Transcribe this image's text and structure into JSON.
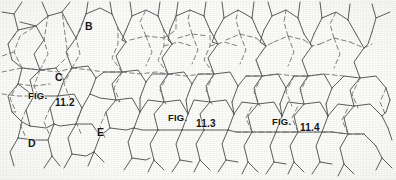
{
  "figure": {
    "type": "hexagonal-lattice-diagram",
    "background_color": "#fdfdfb",
    "solid_line_color": "#4a4a4a",
    "dashed_line_color": "#6d6d6d",
    "width": 396,
    "height": 180
  },
  "captions": [
    {
      "id": "fig-11-2",
      "prefix": "FIG.",
      "number": "11.2",
      "x": 28,
      "y": 90,
      "num_x": 55,
      "num_y": 97
    },
    {
      "id": "fig-11-3",
      "prefix": "FIG.",
      "number": "11.3",
      "x": 168,
      "y": 112,
      "num_x": 196,
      "num_y": 118
    },
    {
      "id": "fig-11-4",
      "prefix": "FIG.",
      "number": "11.4",
      "x": 272,
      "y": 116,
      "num_x": 300,
      "num_y": 122
    }
  ],
  "node_labels": [
    {
      "id": "label-b",
      "text": "B",
      "x": 85,
      "y": 20
    },
    {
      "id": "label-c",
      "text": "C",
      "x": 55,
      "y": 71
    },
    {
      "id": "label-d",
      "text": "D",
      "x": 28,
      "y": 137
    },
    {
      "id": "label-e",
      "text": "E",
      "x": 97,
      "y": 126
    }
  ],
  "lattice": {
    "solid_paths": [
      "M 22 2 L 14 14 L 2 12",
      "M 14 14 L 18 30",
      "M 42 2 L 48 16",
      "M 48 16 L 36 26 L 20 22",
      "M 48 16 L 62 12 L 70 2",
      "M 62 12 L 68 24",
      "M 88 2 L 86 14",
      "M 86 14 L 100 8 L 112 14",
      "M 112 14 L 110 2",
      "M 112 14 L 118 28",
      "M 86 14 L 80 30",
      "M 130 2 L 132 16",
      "M 132 16 L 146 10 L 158 16",
      "M 158 16 L 160 2",
      "M 158 16 L 164 30",
      "M 132 16 L 126 30",
      "M 178 2 L 176 16",
      "M 176 16 L 190 10 L 204 16",
      "M 204 16 L 206 2",
      "M 204 16 L 210 30",
      "M 176 16 L 170 30",
      "M 222 2 L 224 18",
      "M 224 18 L 238 10 L 252 18",
      "M 252 18 L 254 2",
      "M 252 18 L 258 32",
      "M 224 18 L 216 32",
      "M 268 2 L 272 16 L 286 10 L 298 18",
      "M 298 18 L 300 2",
      "M 298 18 L 304 34",
      "M 272 16 L 264 30",
      "M 320 2 L 322 18",
      "M 322 18 L 336 12 L 348 20",
      "M 348 20 L 350 4",
      "M 348 20 L 356 34",
      "M 322 18 L 314 34",
      "M 372 4 L 376 18 L 390 12",
      "M 376 18 L 372 32",
      "M 18 30 L 8 44 L 12 60",
      "M 18 30 L 36 26",
      "M 36 26 L 44 40",
      "M 44 40 L 34 54 L 40 70",
      "M 68 24 L 76 38",
      "M 76 38 L 66 52 L 72 68",
      "M 80 30 L 76 38",
      "M 118 28 L 126 42",
      "M 126 42 L 116 56 L 122 72",
      "M 126 30 L 122 40",
      "M 122 40 L 126 42",
      "M 164 30 L 172 44",
      "M 172 44 L 162 58 L 168 74",
      "M 170 30 L 168 40 L 172 44",
      "M 210 30 L 218 44",
      "M 218 44 L 208 58 L 214 74",
      "M 216 32 L 212 42 L 218 44",
      "M 258 32 L 266 46",
      "M 266 46 L 256 60 L 262 76",
      "M 264 30 L 260 42 L 266 46",
      "M 304 34 L 312 46",
      "M 312 46 L 302 60 L 308 76",
      "M 314 34 L 310 44 L 312 46",
      "M 356 34 L 364 48",
      "M 364 48 L 354 62 L 360 78",
      "M 372 32 L 368 44 L 364 48",
      "M 12 60 L 22 68",
      "M 22 68 L 18 84",
      "M 40 70 L 30 80 L 34 96",
      "M 22 68 L 40 70",
      "M 40 70 L 56 68 L 64 80",
      "M 64 80 L 58 96",
      "M 72 68 L 64 80",
      "M 72 68 L 88 66 L 96 78",
      "M 96 78 L 90 94",
      "M 122 72 L 112 84 L 116 100",
      "M 122 72 L 104 72 L 96 78",
      "M 122 72 L 138 70 L 146 82",
      "M 146 82 L 140 98",
      "M 168 74 L 160 86 L 164 102",
      "M 168 74 L 152 74 L 146 82",
      "M 168 74 L 184 72 L 192 84",
      "M 192 84 L 186 100",
      "M 214 74 L 206 86 L 210 102",
      "M 214 74 L 198 74 L 192 84",
      "M 214 74 L 230 72 L 238 86",
      "M 238 86 L 232 102",
      "M 262 76 L 254 88 L 258 104",
      "M 262 76 L 246 76 L 238 86",
      "M 262 76 L 278 74 L 286 88",
      "M 286 88 L 280 104",
      "M 308 76 L 300 88 L 304 104",
      "M 308 76 L 294 76 L 286 88",
      "M 308 76 L 324 74 L 332 88",
      "M 332 88 L 326 104",
      "M 360 78 L 350 90 L 354 106",
      "M 360 78 L 344 76 L 332 88",
      "M 360 78 L 376 76 L 386 88",
      "M 386 88 L 390 100",
      "M 18 84 L 8 96 L 12 112",
      "M 18 84 L 34 96",
      "M 34 96 L 26 110 L 30 126",
      "M 58 96 L 50 108 L 54 124",
      "M 58 96 L 42 96 L 34 96",
      "M 58 96 L 74 94 L 82 108",
      "M 82 108 L 76 124",
      "M 90 94 L 82 108",
      "M 116 100 L 106 112 L 110 128",
      "M 116 100 L 100 98 L 90 94",
      "M 116 100 L 132 98 L 140 112",
      "M 140 112 L 134 128",
      "M 140 98 L 140 112",
      "M 164 102 L 154 114 L 158 130",
      "M 164 102 L 148 100 L 140 112",
      "M 164 102 L 180 100 L 188 114",
      "M 188 114 L 182 130",
      "M 186 100 L 188 114",
      "M 210 102 L 200 114 L 204 130",
      "M 210 102 L 194 100 L 188 114",
      "M 210 102 L 226 100 L 234 114",
      "M 234 114 L 228 130",
      "M 232 102 L 234 114",
      "M 258 104 L 248 116 L 252 132",
      "M 258 104 L 242 102 L 234 114",
      "M 258 104 L 274 102 L 282 116",
      "M 282 116 L 276 132",
      "M 280 104 L 282 116",
      "M 304 104 L 294 116 L 298 132",
      "M 304 104 L 288 102 L 282 116",
      "M 304 104 L 320 102 L 328 116",
      "M 328 116 L 322 132",
      "M 326 104 L 328 116",
      "M 354 106 L 344 118 L 348 134",
      "M 354 106 L 338 104 L 328 116",
      "M 354 106 L 370 104 L 382 116",
      "M 382 116 L 388 128",
      "M 12 112 L 22 122 L 18 138",
      "M 30 126 L 22 122",
      "M 30 126 L 46 128 L 54 124",
      "M 54 124 L 48 140 L 52 156",
      "M 76 124 L 68 138 L 72 154",
      "M 76 124 L 60 126 L 54 124",
      "M 76 124 L 92 124 L 100 136",
      "M 100 136 L 94 152",
      "M 110 128 L 100 136",
      "M 110 128 L 126 130 L 134 128",
      "M 134 128 L 128 142 L 132 158",
      "M 158 130 L 150 144 L 154 160",
      "M 158 130 L 142 130 L 134 128",
      "M 158 130 L 174 130 L 182 130",
      "M 182 130 L 176 144 L 180 160",
      "M 204 130 L 196 144 L 200 160",
      "M 204 130 L 190 130 L 182 130",
      "M 204 130 L 220 130 L 228 130",
      "M 228 130 L 222 144 L 226 160",
      "M 252 132 L 244 146 L 248 162",
      "M 252 132 L 236 132 L 228 130",
      "M 252 132 L 268 132 L 276 132",
      "M 276 132 L 270 146 L 274 162",
      "M 298 132 L 290 146 L 294 162",
      "M 298 132 L 284 132 L 276 132",
      "M 298 132 L 314 132 L 322 132",
      "M 322 132 L 316 146 L 320 162",
      "M 348 134 L 340 148 L 344 164",
      "M 348 134 L 332 132 L 322 132",
      "M 348 134 L 364 134 L 376 146",
      "M 376 146 L 382 158",
      "M 18 138 L 10 152 L 14 166",
      "M 18 138 L 34 140 L 48 140",
      "M 52 156 L 44 168",
      "M 52 156 L 60 166",
      "M 72 154 L 64 168",
      "M 72 154 L 86 156 L 94 152",
      "M 94 152 L 88 166",
      "M 94 152 L 104 162",
      "M 132 158 L 124 170",
      "M 132 158 L 146 160 L 150 158",
      "M 154 160 L 148 172",
      "M 154 160 L 164 170",
      "M 180 160 L 172 172",
      "M 180 160 L 192 162",
      "M 200 160 L 194 172",
      "M 200 160 L 210 170",
      "M 226 160 L 218 172",
      "M 226 160 L 238 162",
      "M 248 162 L 242 174",
      "M 248 162 L 258 172",
      "M 274 162 L 266 174",
      "M 274 162 L 286 164",
      "M 294 162 L 288 174",
      "M 294 162 L 304 172",
      "M 320 162 L 312 174",
      "M 320 162 L 332 164",
      "M 344 164 L 338 176",
      "M 344 164 L 354 174",
      "M 382 158 L 376 170",
      "M 382 158 L 392 168",
      "M 388 128 L 392 140",
      "M 390 100 L 386 112",
      "M 386 112 L 382 116"
    ],
    "dashed_paths": [
      "M 2 72 L 22 68 L 40 70 L 56 68",
      "M 22 68 L 14 52 L 20 36 L 36 26",
      "M 14 52 L 2 56",
      "M 40 70 L 48 54 L 44 40 L 48 16",
      "M 40 70 L 34 86 L 40 100 L 34 96",
      "M 40 70 L 58 72 L 72 68",
      "M 56 68 L 68 56 L 62 12",
      "M 72 68 L 80 54 L 76 38 L 86 14",
      "M 72 68 L 64 84 L 70 98",
      "M 72 68 L 90 70 L 104 72 L 122 72",
      "M 122 72 L 112 58 L 118 44 L 118 28",
      "M 122 72 L 114 88 L 120 102 L 116 100",
      "M 122 72 L 140 74 L 156 72 L 168 74",
      "M 168 74 L 158 60 L 164 46 L 164 30",
      "M 168 74 L 160 90 L 166 104",
      "M 168 74 L 186 76 L 202 74 L 214 74",
      "M 214 74 L 204 60 L 210 46 L 210 30",
      "M 214 74 L 206 90 L 212 104",
      "M 130 40 L 146 36 L 164 38",
      "M 146 36 L 140 22 L 146 10",
      "M 146 36 L 152 52 L 146 66",
      "M 164 38 L 176 30 L 176 16",
      "M 178 38 L 192 34 L 208 36",
      "M 192 34 L 188 20 L 190 10",
      "M 192 34 L 198 50 L 192 64",
      "M 226 40 L 240 34 L 256 38",
      "M 240 34 L 236 20 L 238 10",
      "M 240 34 L 246 50 L 240 64",
      "M 274 42 L 288 36 L 304 40",
      "M 288 36 L 284 22 L 286 10",
      "M 288 36 L 294 52 L 288 66",
      "M 256 38 L 266 46 L 274 42",
      "M 304 40 L 312 46 L 320 44",
      "M 320 44 L 334 38 L 350 42",
      "M 334 38 L 330 24 L 336 12",
      "M 334 38 L 340 54 L 334 68",
      "M 350 42 L 364 48 L 372 44",
      "M 246 76 L 262 76 L 278 74 L 294 76",
      "M 262 76 L 254 92 L 260 106",
      "M 262 76 L 256 60",
      "M 294 76 L 286 92 L 292 106",
      "M 294 76 L 308 76 L 324 74 L 344 76",
      "M 308 76 L 300 92",
      "M 236 132 L 252 132 L 268 132 L 284 132",
      "M 252 132 L 246 118 L 252 106",
      "M 284 132 L 298 132 L 314 132 L 332 132",
      "M 298 132 L 292 118 L 298 106",
      "M 332 132 L 348 134 L 364 134",
      "M 348 134 L 342 120 L 348 108",
      "M 18 84 L 10 98 L 16 112 L 12 112",
      "M 18 84 L 34 86 L 50 84",
      "M 8 44 L 18 30",
      "M 2 94 L 18 96 L 34 96",
      "M 26 110 L 20 124 L 26 138",
      "M 50 108 L 44 122 L 50 136",
      "M 82 108 L 76 122 L 82 136",
      "M 106 112 L 100 126 L 106 140",
      "M 360 78 L 352 94 L 358 108",
      "M 386 88 L 380 102 L 386 116",
      "M 164 46 L 178 42 L 192 46",
      "M 210 46 L 224 42 L 238 46"
    ]
  }
}
